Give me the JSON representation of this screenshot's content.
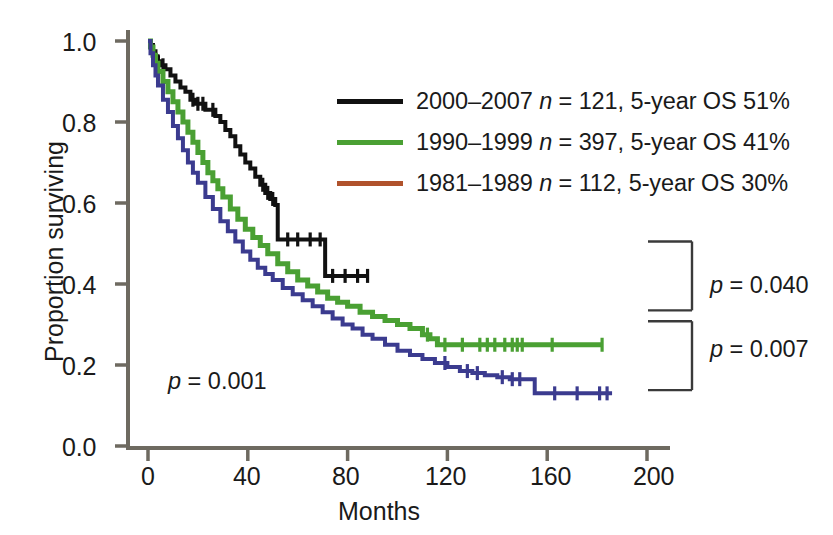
{
  "chart_data": {
    "type": "line",
    "title": "",
    "xlabel": "Months",
    "ylabel": "Proportion surviving",
    "xlim": [
      0,
      208
    ],
    "ylim": [
      0.0,
      1.0
    ],
    "xticks": [
      0,
      40,
      80,
      120,
      160,
      200
    ],
    "xtick_labels": [
      "0",
      "40",
      "80",
      "120",
      "160",
      "200"
    ],
    "yticks": [
      0.0,
      0.2,
      0.4,
      0.6,
      0.8,
      1.0
    ],
    "ytick_labels": [
      "0.0",
      "0.2",
      "0.4",
      "0.6",
      "0.8",
      "1.0"
    ],
    "grid": false,
    "legend_position": "upper-center-right",
    "censoring_marks": true,
    "series": [
      {
        "name": "2000-2007",
        "label": "2000–2007 n = 121, 5-year OS 51%",
        "period": "2000–2007",
        "n": 121,
        "five_year_os": "51%",
        "color": "#111111",
        "swatch_color": "#111111",
        "points": [
          [
            0,
            1.0
          ],
          [
            1,
            0.99
          ],
          [
            2,
            0.975
          ],
          [
            3,
            0.96
          ],
          [
            4,
            0.95
          ],
          [
            5,
            0.94
          ],
          [
            7,
            0.93
          ],
          [
            9,
            0.915
          ],
          [
            11,
            0.9
          ],
          [
            13,
            0.885
          ],
          [
            15,
            0.875
          ],
          [
            17,
            0.855
          ],
          [
            19,
            0.845
          ],
          [
            21,
            0.845
          ],
          [
            23,
            0.83
          ],
          [
            25,
            0.83
          ],
          [
            27,
            0.815
          ],
          [
            29,
            0.8
          ],
          [
            31,
            0.78
          ],
          [
            33,
            0.765
          ],
          [
            35,
            0.74
          ],
          [
            37,
            0.72
          ],
          [
            39,
            0.7
          ],
          [
            41,
            0.685
          ],
          [
            43,
            0.665
          ],
          [
            45,
            0.645
          ],
          [
            47,
            0.625
          ],
          [
            49,
            0.61
          ],
          [
            51,
            0.595
          ],
          [
            52,
            0.51
          ],
          [
            57,
            0.51
          ],
          [
            62,
            0.51
          ],
          [
            68,
            0.51
          ],
          [
            71,
            0.42
          ],
          [
            76,
            0.42
          ],
          [
            82,
            0.42
          ],
          [
            88,
            0.42
          ]
        ],
        "censor_x": [
          2,
          4,
          6,
          18,
          20,
          22,
          26,
          46,
          48,
          50,
          56,
          60,
          65,
          69,
          74,
          79,
          84,
          88
        ]
      },
      {
        "name": "1990-1999",
        "label": "1990–1999 n = 397, 5-year OS 41%",
        "period": "1990–1999",
        "n": 397,
        "five_year_os": "41%",
        "color": "#4aa033",
        "swatch_color": "#4aa033",
        "points": [
          [
            0,
            1.0
          ],
          [
            1,
            0.985
          ],
          [
            2,
            0.965
          ],
          [
            3,
            0.945
          ],
          [
            4,
            0.925
          ],
          [
            6,
            0.9
          ],
          [
            8,
            0.875
          ],
          [
            10,
            0.85
          ],
          [
            12,
            0.825
          ],
          [
            14,
            0.8
          ],
          [
            16,
            0.775
          ],
          [
            18,
            0.75
          ],
          [
            20,
            0.725
          ],
          [
            22,
            0.7
          ],
          [
            24,
            0.675
          ],
          [
            26,
            0.655
          ],
          [
            28,
            0.635
          ],
          [
            30,
            0.615
          ],
          [
            33,
            0.585
          ],
          [
            36,
            0.56
          ],
          [
            39,
            0.535
          ],
          [
            42,
            0.515
          ],
          [
            45,
            0.495
          ],
          [
            48,
            0.475
          ],
          [
            52,
            0.45
          ],
          [
            56,
            0.43
          ],
          [
            60,
            0.41
          ],
          [
            64,
            0.395
          ],
          [
            68,
            0.38
          ],
          [
            72,
            0.365
          ],
          [
            76,
            0.355
          ],
          [
            80,
            0.345
          ],
          [
            85,
            0.33
          ],
          [
            90,
            0.32
          ],
          [
            95,
            0.31
          ],
          [
            100,
            0.3
          ],
          [
            105,
            0.29
          ],
          [
            110,
            0.275
          ],
          [
            113,
            0.265
          ],
          [
            116,
            0.25
          ],
          [
            122,
            0.25
          ],
          [
            130,
            0.25
          ],
          [
            140,
            0.25
          ],
          [
            150,
            0.25
          ],
          [
            160,
            0.25
          ],
          [
            170,
            0.25
          ],
          [
            182,
            0.25
          ]
        ],
        "censor_x": [
          112,
          119,
          126,
          133,
          136,
          139,
          143,
          146,
          148,
          150,
          162,
          182
        ]
      },
      {
        "name": "1981-1989",
        "label": "1981–1989 n = 112, 5-year OS 30%",
        "period": "1981–1989",
        "n": 112,
        "five_year_os": "30%",
        "color": "#3b3b8f",
        "swatch_color": "#b0522c",
        "points": [
          [
            0,
            1.0
          ],
          [
            1,
            0.97
          ],
          [
            2,
            0.94
          ],
          [
            3,
            0.915
          ],
          [
            4,
            0.89
          ],
          [
            6,
            0.855
          ],
          [
            8,
            0.825
          ],
          [
            10,
            0.79
          ],
          [
            12,
            0.76
          ],
          [
            14,
            0.73
          ],
          [
            16,
            0.7
          ],
          [
            18,
            0.675
          ],
          [
            20,
            0.65
          ],
          [
            23,
            0.615
          ],
          [
            26,
            0.585
          ],
          [
            29,
            0.555
          ],
          [
            32,
            0.53
          ],
          [
            35,
            0.505
          ],
          [
            38,
            0.48
          ],
          [
            41,
            0.46
          ],
          [
            44,
            0.44
          ],
          [
            47,
            0.425
          ],
          [
            50,
            0.41
          ],
          [
            54,
            0.39
          ],
          [
            58,
            0.375
          ],
          [
            62,
            0.36
          ],
          [
            66,
            0.345
          ],
          [
            70,
            0.33
          ],
          [
            74,
            0.315
          ],
          [
            78,
            0.3
          ],
          [
            82,
            0.29
          ],
          [
            86,
            0.275
          ],
          [
            90,
            0.265
          ],
          [
            95,
            0.25
          ],
          [
            100,
            0.235
          ],
          [
            105,
            0.225
          ],
          [
            110,
            0.215
          ],
          [
            115,
            0.205
          ],
          [
            120,
            0.195
          ],
          [
            125,
            0.185
          ],
          [
            130,
            0.18
          ],
          [
            135,
            0.175
          ],
          [
            140,
            0.17
          ],
          [
            145,
            0.165
          ],
          [
            152,
            0.165
          ],
          [
            155,
            0.13
          ],
          [
            162,
            0.13
          ],
          [
            170,
            0.13
          ],
          [
            178,
            0.13
          ],
          [
            186,
            0.13
          ]
        ],
        "censor_x": [
          119,
          128,
          132,
          142,
          146,
          149,
          163,
          172,
          181,
          184
        ]
      }
    ],
    "annotations": [
      {
        "name": "overall-p-value",
        "text": "p = 0.001",
        "italic_prefix": "p",
        "rest": " = 0.001",
        "x_data": 13,
        "y_data": 0.125
      },
      {
        "name": "bracket-p-040",
        "text": "p = 0.040",
        "italic_prefix": "p",
        "rest": " = 0.040",
        "bracket_top_y": 0.505,
        "bracket_bottom_y": 0.335
      },
      {
        "name": "bracket-p-007",
        "text": "p = 0.007",
        "italic_prefix": "p",
        "rest": " = 0.007",
        "bracket_top_y": 0.308,
        "bracket_bottom_y": 0.138
      }
    ]
  },
  "axes": {
    "x_title": "Months",
    "y_title": "Proportion surviving",
    "x_tick_labels": [
      "0",
      "40",
      "80",
      "120",
      "160",
      "200"
    ],
    "y_tick_labels": [
      "1.0",
      "0.8",
      "0.6",
      "0.4",
      "0.2",
      "0.0"
    ],
    "axis_color": "#6e6a60"
  },
  "legend": {
    "entries": [
      {
        "label": "2000–2007 n = 121, 5-year OS 51%",
        "swatch_color": "#111111",
        "period": "2000–2007",
        "n_text": "n = 121",
        "os_text": "5-year OS 51%"
      },
      {
        "label": "1990–1999 n = 397, 5-year OS 41%",
        "swatch_color": "#4aa033",
        "period": "1990–1999",
        "n_text": "n = 397",
        "os_text": "5-year OS 41%"
      },
      {
        "label": "1981–1989 n = 112, 5-year OS 30%",
        "swatch_color": "#b0522c",
        "period": "1981–1989",
        "n_text": "n = 112",
        "os_text": "5-year OS 30%"
      }
    ]
  },
  "pvalues": {
    "overall": "p = 0.001",
    "bracket_upper": "p = 0.040",
    "bracket_lower": "p = 0.007"
  }
}
